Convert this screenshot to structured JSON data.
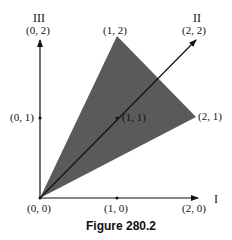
{
  "figure": {
    "caption": "Figure 280.2",
    "fill_color": "#5a5a5a",
    "axes": {
      "axis_I": "I",
      "axis_II": "II",
      "axis_III": "III"
    },
    "points": {
      "origin": "(0, 0)",
      "p10": "(1, 0)",
      "p20": "(2, 0)",
      "p01": "(0, 1)",
      "p02": "(0, 2)",
      "p11": "(1, 1)",
      "p12": "(1, 2)",
      "p21": "(2, 1)",
      "p22": "(2, 2)"
    },
    "shaded_triangle_vertices": [
      "(0, 0)",
      "(1, 2)",
      "(2, 1)"
    ]
  }
}
